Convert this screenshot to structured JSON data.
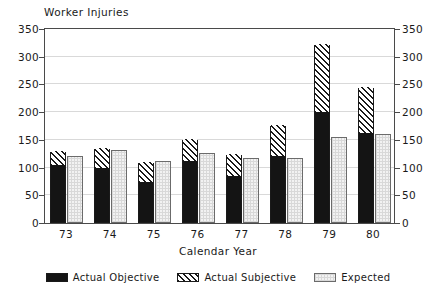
{
  "chart_data": {
    "type": "bar",
    "title": "Worker Injuries",
    "xlabel": "Calendar Year",
    "ylabel": "",
    "categories": [
      "73",
      "74",
      "75",
      "76",
      "77",
      "78",
      "79",
      "80"
    ],
    "series": [
      {
        "name": "Actual Objective",
        "values": [
          102,
          97,
          72,
          110,
          83,
          120,
          198,
          160
        ]
      },
      {
        "name": "Actual Subjective",
        "values": [
          26,
          36,
          36,
          40,
          39,
          55,
          124,
          84
        ]
      },
      {
        "name": "Expected",
        "values": [
          121,
          132,
          111,
          127,
          117,
          117,
          155,
          161
        ]
      }
    ],
    "stacked_totals": [
      128,
      133,
      108,
      150,
      122,
      175,
      322,
      244
    ],
    "ylim": [
      0,
      350
    ],
    "yticks": [
      0,
      50,
      100,
      150,
      200,
      250,
      300,
      350
    ],
    "yticks_right": [
      0,
      50,
      100,
      150,
      200,
      250,
      300,
      350
    ],
    "grid": true,
    "legend_position": "bottom",
    "colors": {
      "actual_objective": "#141414",
      "actual_subjective": "#ffffff",
      "expected": "#f2f2f2",
      "axis": "#4a4a4a",
      "gridline": "#d9d9d9"
    }
  },
  "legend": {
    "entries": [
      {
        "label": "Actual Objective"
      },
      {
        "label": "Actual Subjective"
      },
      {
        "label": "Expected"
      }
    ]
  }
}
